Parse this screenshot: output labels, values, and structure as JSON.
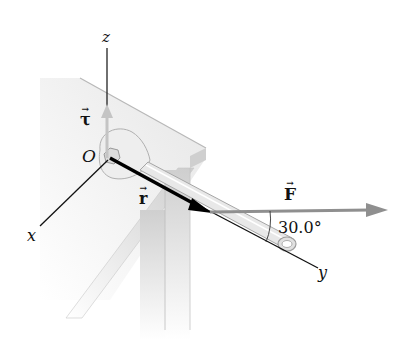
{
  "diagram": {
    "colors": {
      "axis": "#111111",
      "position_vector": "#000000",
      "force_vector": "#8a8a8a",
      "torque_vector": "#c4c4c4",
      "table_top": "#ececec",
      "table_edge": "#bdbdbd",
      "table_leg": "#d0d0d0",
      "wrench": "#e4e4e4"
    },
    "axes": {
      "z": {
        "label": "z"
      },
      "x": {
        "label": "x"
      },
      "y": {
        "label": "y"
      }
    },
    "origin": {
      "label": "O"
    },
    "vectors": {
      "torque": {
        "symbol": "τ",
        "arrow": "→"
      },
      "position": {
        "symbol": "r",
        "arrow": "→"
      },
      "force": {
        "symbol": "F",
        "arrow": "→"
      }
    },
    "angle": {
      "label": "30.0°",
      "value": 30.0,
      "unit": "degrees"
    }
  }
}
